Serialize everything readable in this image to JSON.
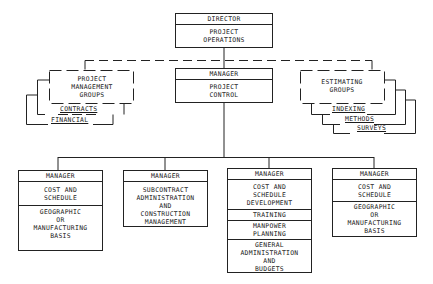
{
  "director": {
    "title": "DIRECTOR",
    "unit": "PROJECT\nOPERATIONS"
  },
  "project_control": {
    "title": "MANAGER",
    "unit": "PROJECT\nCONTROL"
  },
  "project_management_groups": {
    "label": "PROJECT\nMANAGEMENT\nGROUPS",
    "stack": [
      "CONTRACTS",
      "FINANCIAL"
    ]
  },
  "estimating_groups": {
    "label": "ESTIMATING\nGROUPS",
    "stack": [
      "INDEXING",
      "METHODS",
      "SURVEYS"
    ]
  },
  "managers": [
    {
      "title": "MANAGER",
      "sections": [
        "COST AND\nSCHEDULE",
        "GEOGRAPHIC\nOR\nMANUFACTURING\nBASIS"
      ]
    },
    {
      "title": "MANAGER",
      "sections": [
        "SUBCONTRACT\nADMINISTRATION\nAND\nCONSTRUCTION\nMANAGEMENT"
      ]
    },
    {
      "title": "MANAGER",
      "sections": [
        "COST AND\nSCHEDULE\nDEVELOPMENT",
        "TRAINING",
        "MANPOWER\nPLANNING",
        "GENERAL\nADMINISTRATION\nAND\nBUDGETS"
      ]
    },
    {
      "title": "MANAGER",
      "sections": [
        "COST AND\nSCHEDULE",
        "GEOGRAPHIC\nOR\nMANUFACTURING\nBASIS"
      ]
    }
  ],
  "colors": {
    "line": "#222222",
    "background": "#ffffff"
  }
}
